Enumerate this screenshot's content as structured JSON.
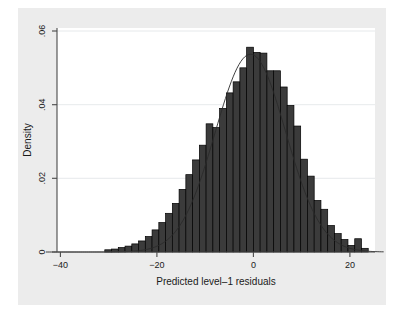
{
  "figure": {
    "background_color": "#ffffff",
    "graph_region_color": "#ececec",
    "plot_background_color": "#ffffff"
  },
  "chart_data": {
    "type": "bar",
    "title": "",
    "subtitle": "",
    "xlabel": "Predicted level–1 residuals",
    "ylabel": "Density",
    "xlim": [
      -43,
      27
    ],
    "ylim": [
      0,
      0.0625
    ],
    "xticks": [
      -40,
      -20,
      0,
      20
    ],
    "xtick_labels": [
      "−40",
      "−20",
      "0",
      "20"
    ],
    "yticks": [
      0,
      0.02,
      0.04,
      0.06
    ],
    "ytick_labels": [
      "0",
      ".02",
      ".04",
      ".06"
    ],
    "grid": true,
    "grid_axis": "y",
    "legend": "none",
    "bar_fill_color": "#3b3b3b",
    "bar_edge_color": "#000000",
    "curve_color": "#2a2a2a",
    "bin_width": 1.4,
    "categories": [
      -30.1,
      -28.7,
      -27.3,
      -25.9,
      -24.5,
      -23.1,
      -21.7,
      -20.3,
      -18.9,
      -17.5,
      -16.1,
      -14.7,
      -13.3,
      -11.9,
      -10.5,
      -9.1,
      -7.7,
      -6.3,
      -4.9,
      -3.5,
      -2.1,
      -0.7,
      0.7,
      2.1,
      3.5,
      4.9,
      6.3,
      7.7,
      9.1,
      10.5,
      11.9,
      13.3,
      14.7,
      16.1,
      17.5,
      18.9,
      20.3,
      21.7,
      23.1
    ],
    "values": [
      0.0006,
      0.0008,
      0.0012,
      0.0016,
      0.0022,
      0.003,
      0.0042,
      0.006,
      0.008,
      0.0105,
      0.0132,
      0.017,
      0.021,
      0.025,
      0.029,
      0.0348,
      0.0338,
      0.039,
      0.0432,
      0.0462,
      0.05,
      0.0556,
      0.0542,
      0.054,
      0.0492,
      0.0492,
      0.0448,
      0.0398,
      0.0342,
      0.0252,
      0.0206,
      0.014,
      0.0116,
      0.0072,
      0.005,
      0.0034,
      0.0018,
      0.0036,
      0.001
    ],
    "density_overlay": {
      "label": "normal density",
      "mean": -0.6,
      "sd": 7.3,
      "peak": 0.0537
    }
  }
}
